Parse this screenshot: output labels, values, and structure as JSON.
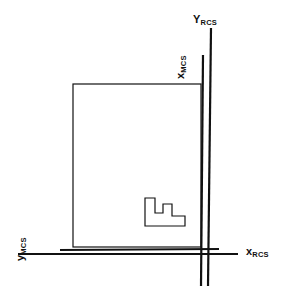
{
  "diagram": {
    "background_color": "#ffffff",
    "line_color": "#111111",
    "labels": {
      "y_rcs": {
        "base": "Y",
        "subscript": "RCS",
        "axis": "vertical",
        "system": "RCS"
      },
      "x_mcs": {
        "base": "x",
        "subscript": "MCS",
        "axis": "vertical",
        "system": "MCS"
      },
      "y_mcs": {
        "base": "y",
        "subscript": "MCS",
        "axis": "horizontal",
        "system": "MCS"
      },
      "x_rcs": {
        "base": "x",
        "subscript": "RCS",
        "axis": "horizontal",
        "system": "RCS"
      }
    },
    "geometry": {
      "workpiece_rect": {
        "x": 73,
        "y": 84,
        "width": 128,
        "height": 163,
        "stroke_width": 1.2
      },
      "rcs_horizontal_axis": {
        "x1": 18,
        "y1": 254,
        "x2": 238,
        "y2": 254,
        "stroke_width": 2.2
      },
      "rcs_vertical_axis": {
        "x1": 211,
        "y1": 28,
        "x2": 208,
        "y2": 286,
        "stroke_width": 2.2
      },
      "mcs_horizontal_axis": {
        "x1": 60,
        "y1": 250,
        "x2": 219,
        "y2": 249,
        "stroke_width": 2.2
      },
      "mcs_vertical_axis": {
        "x1": 203,
        "y1": 55,
        "x2": 201,
        "y2": 286,
        "stroke_width": 2.2
      },
      "step_feature": {
        "stroke_width": 1.2,
        "points": "145,198 155,198 155,213 163,213 163,204 172,204 172,216 185,216 185,226 145,226"
      }
    }
  }
}
